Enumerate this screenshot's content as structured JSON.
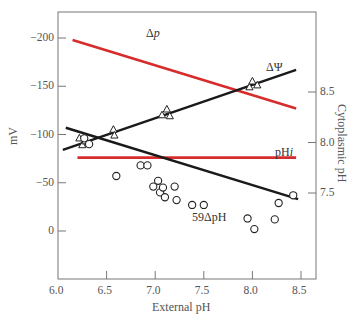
{
  "chart_data": {
    "type": "scatter",
    "title": "",
    "xlabel": "External pH",
    "ylabel": "mV",
    "ylabel_right": "Cytoplasmic pH",
    "xlim": [
      6.0,
      8.55
    ],
    "ylim": [
      40,
      -225
    ],
    "yticks": [
      -200,
      -150,
      -100,
      -50,
      0
    ],
    "ytick_labels": [
      "−200",
      "−150",
      "−100",
      "−50",
      "0"
    ],
    "xticks": [
      6.0,
      6.5,
      7.0,
      7.5,
      8.0,
      8.5
    ],
    "xtick_labels": [
      "6.0",
      "6.5",
      "7.0",
      "7.5",
      "8.0",
      "8.5"
    ],
    "yticks_right": [
      7.5,
      8.0,
      8.5
    ],
    "ytick_right_labels": [
      "7.5",
      "8.0",
      "8.5"
    ],
    "grid": false,
    "series": [
      {
        "name": "Δp",
        "label": "Δ",
        "label_italic": "p",
        "kind": "line",
        "color": "#d62c2c",
        "x": [
          6.15,
          8.45
        ],
        "y": [
          -198,
          -127
        ]
      },
      {
        "name": "ΔΨ",
        "label": "ΔΨ",
        "kind": "line+markers",
        "marker": "triangle",
        "color": "#1a1a1a",
        "x": [
          6.22,
          6.25,
          6.28,
          6.57,
          6.58,
          7.07,
          7.12,
          7.15,
          7.97,
          8.0,
          8.05
        ],
        "y": [
          -96,
          -89,
          -93,
          -105,
          -99,
          -120,
          -126,
          -119,
          -149,
          -155,
          -151
        ],
        "fit": {
          "x": [
            6.05,
            8.45
          ],
          "y": [
            -84,
            -167
          ]
        }
      },
      {
        "name": "pHi",
        "label": "pH",
        "label_italic": "i",
        "kind": "line",
        "color": "#d62c2c",
        "axis": "right",
        "x": [
          6.2,
          8.45
        ],
        "y": [
          7.85,
          7.85
        ],
        "y_mv_equiv": [
          -74,
          -74
        ]
      },
      {
        "name": "59ΔpH",
        "label": "59ΔpH",
        "kind": "line+markers",
        "marker": "circle",
        "color": "#1a1a1a",
        "x": [
          6.27,
          6.32,
          6.6,
          6.85,
          6.92,
          6.98,
          7.03,
          7.05,
          7.08,
          7.1,
          7.2,
          7.22,
          7.38,
          7.5,
          7.95,
          8.02,
          8.23,
          8.27,
          8.42
        ],
        "y": [
          -96,
          -90,
          -57,
          -68,
          -68,
          -46,
          -52,
          -40,
          -45,
          -35,
          -46,
          -32,
          -27,
          -27,
          -13,
          -2,
          -12,
          -29,
          -37
        ],
        "fit": {
          "x": [
            6.08,
            8.47
          ],
          "y": [
            -107,
            -33
          ]
        }
      }
    ]
  }
}
